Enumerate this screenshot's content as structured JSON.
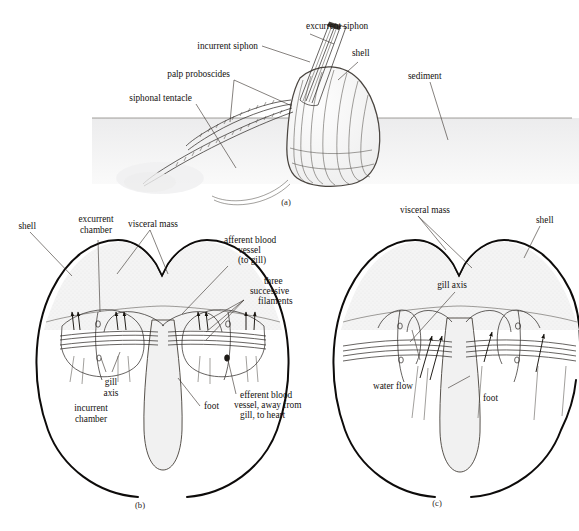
{
  "figure": {
    "background_color": "#ffffff",
    "ink_color": "#14110f",
    "sediment_color": "#f2f2f3",
    "tissue_shade": "#f6f6f6"
  },
  "panel_a": {
    "letter": "(a)",
    "labels": {
      "excurrent_siphon": "excurrent siphon",
      "incurrent_siphon": "incurrent siphon",
      "palp_proboscides": "palp proboscides",
      "siphonal_tentacle": "siphonal tentacle",
      "shell": "shell",
      "sediment": "sediment"
    }
  },
  "panel_b": {
    "letter": "(b)",
    "labels": {
      "shell": "shell",
      "excurrent_chamber": "excurrent\nchamber",
      "excurrent_chamber_l1": "excurrent",
      "excurrent_chamber_l2": "chamber",
      "visceral_mass": "visceral mass",
      "afferent_l1": "afferent blood",
      "afferent_l2": "vessel",
      "afferent_l3": "(to gill)",
      "three_filaments_l1": "three",
      "three_filaments_l2": "successive",
      "three_filaments_l3": "filaments",
      "gill_axis_l1": "gill",
      "gill_axis_l2": "axis",
      "incurrent_chamber_l1": "incurrent",
      "incurrent_chamber_l2": "chamber",
      "foot": "foot",
      "efferent_l1": "efferent blood",
      "efferent_l2": "vessel, away from",
      "efferent_l3": "gill, to heart"
    }
  },
  "panel_c": {
    "letter": "(c)",
    "labels": {
      "visceral_mass": "visceral mass",
      "shell": "shell",
      "gill_axis": "gill axis",
      "water_flow": "water flow",
      "foot": "foot"
    }
  }
}
